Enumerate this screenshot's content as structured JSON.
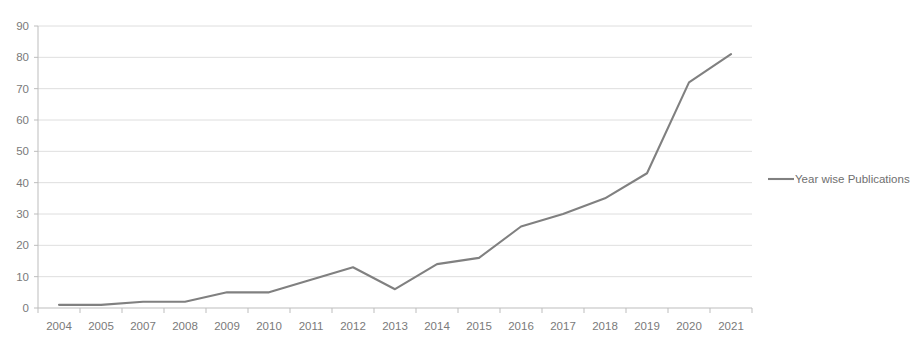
{
  "chart_data": {
    "type": "line",
    "title": "",
    "xlabel": "",
    "ylabel": "",
    "ylim": [
      0,
      90
    ],
    "ytick_step": 10,
    "yticks": [
      "0",
      "10",
      "20",
      "30",
      "40",
      "50",
      "60",
      "70",
      "80",
      "90"
    ],
    "grid": true,
    "legend_position": "right",
    "categories": [
      "2004",
      "2005",
      "2007",
      "2008",
      "2009",
      "2010",
      "2011",
      "2012",
      "2013",
      "2014",
      "2015",
      "2016",
      "2017",
      "2018",
      "2019",
      "2020",
      "2021"
    ],
    "series": [
      {
        "name": "Year wise Publications",
        "color": "#808080",
        "values": [
          1,
          1,
          2,
          2,
          5,
          5,
          9,
          13,
          6,
          14,
          16,
          26,
          30,
          35,
          43,
          72,
          81
        ]
      }
    ]
  },
  "legend": {
    "entries": [
      {
        "label": "Year wise Publications",
        "color": "#808080"
      }
    ]
  },
  "colors": {
    "series": "#808080",
    "gridline": "#d6d6d6",
    "axis": "#bdbdbd",
    "tick_text": "#7a7a7a",
    "background": "#ffffff"
  }
}
